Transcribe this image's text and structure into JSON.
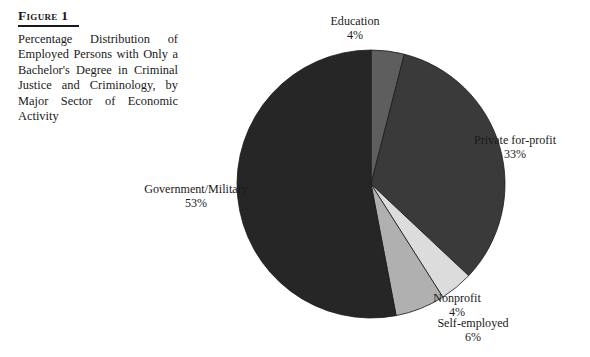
{
  "figure": {
    "number_label": "Figure 1",
    "caption": "Percentage Distribution of Employed Persons with Only a Bachelor's Degree in Criminal Justice and Criminology, by Major Sector of Economic Activity"
  },
  "chart_data": {
    "type": "pie",
    "title": "Percentage Distribution of Employed Persons with Only a Bachelor's Degree in Criminal Justice and Criminology, by Major Sector of Economic Activity",
    "xlabel": "",
    "ylabel": "",
    "units": "percent",
    "total": 100,
    "legend_position": "none",
    "labels_placement": "external",
    "start_angle_deg": 0,
    "direction": "clockwise",
    "categories": [
      "Education",
      "Private for-profit",
      "Nonprofit",
      "Self-employed",
      "Government/Military"
    ],
    "values": [
      4,
      33,
      4,
      6,
      53
    ],
    "colors": [
      "#5e5e5e",
      "#3a3a3a",
      "#dcdcdc",
      "#b0b0b0",
      "#262626"
    ],
    "slices": [
      {
        "name": "Education",
        "value": 4,
        "value_label": "4%",
        "color": "#5e5e5e"
      },
      {
        "name": "Private for-profit",
        "value": 33,
        "value_label": "33%",
        "color": "#3a3a3a"
      },
      {
        "name": "Nonprofit",
        "value": 4,
        "value_label": "4%",
        "color": "#dcdcdc"
      },
      {
        "name": "Self-employed",
        "value": 6,
        "value_label": "6%",
        "color": "#b0b0b0"
      },
      {
        "name": "Government/Military",
        "value": 53,
        "value_label": "53%",
        "color": "#262626"
      }
    ]
  },
  "geometry": {
    "center_x": 371,
    "center_y": 184,
    "radius": 134,
    "stroke_color": "#1a1a1a",
    "stroke_width": 0.8
  }
}
